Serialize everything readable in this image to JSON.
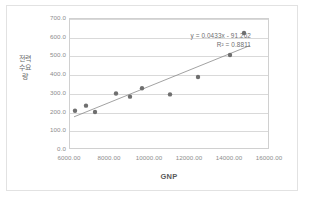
{
  "chart_data": {
    "type": "scatter",
    "title": "",
    "xlabel": "GNP",
    "ylabel": "전력수요량",
    "xlim": [
      6000,
      16000
    ],
    "ylim": [
      0,
      700
    ],
    "grid": true,
    "legend": false,
    "xticks": [
      "6000.00",
      "8000.00",
      "10000.00",
      "12000.00",
      "14000.00",
      "16000.00"
    ],
    "xtick_values": [
      6000,
      8000,
      10000,
      12000,
      14000,
      16000
    ],
    "yticks": [
      "0.0",
      "100.0",
      "200.0",
      "300.0",
      "400.0",
      "500.0",
      "600.0",
      "700.0"
    ],
    "ytick_values": [
      0,
      100,
      200,
      300,
      400,
      500,
      600,
      700
    ],
    "points": [
      {
        "x": 6250,
        "y": 210
      },
      {
        "x": 6800,
        "y": 237
      },
      {
        "x": 7250,
        "y": 203
      },
      {
        "x": 8300,
        "y": 302
      },
      {
        "x": 9000,
        "y": 285
      },
      {
        "x": 9600,
        "y": 330
      },
      {
        "x": 11000,
        "y": 297
      },
      {
        "x": 12400,
        "y": 390
      },
      {
        "x": 14000,
        "y": 508
      },
      {
        "x": 14700,
        "y": 625
      }
    ],
    "trendline": {
      "slope": 0.0433,
      "intercept": -91.262,
      "r_squared": 0.8811,
      "equation_label": "y = 0.0433x - 91.262",
      "r2_label": "R² = 0.8811",
      "x_start": 6200,
      "x_end": 15000
    },
    "colors": {
      "marker": "#6f6f6f",
      "trendline": "#8a8a8a",
      "gridline": "#d9d9d9",
      "axis_text": "#8c8c8c",
      "frame_border": "#e2e2e2",
      "plot_border": "#d0d0d0",
      "background": "#ffffff"
    }
  }
}
